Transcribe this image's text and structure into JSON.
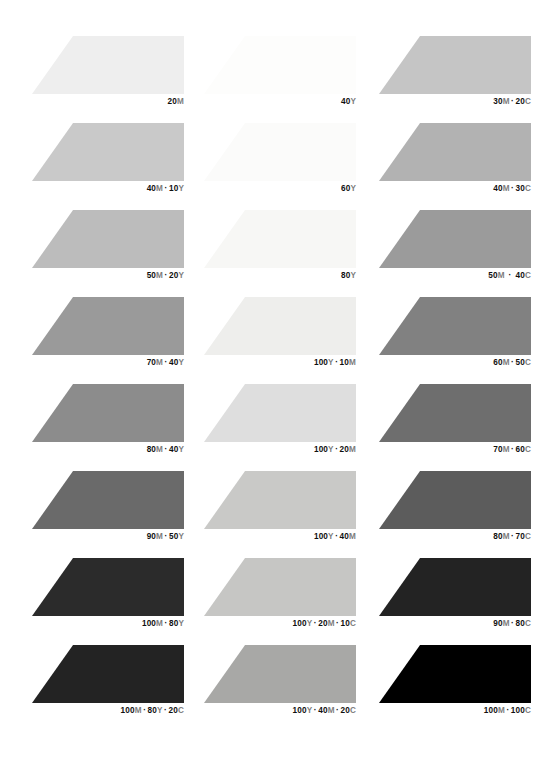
{
  "page": {
    "background": "#ffffff",
    "width": 540,
    "height": 758
  },
  "layout": {
    "columns": 3,
    "rows": 8,
    "column_x": [
      32,
      204,
      379
    ],
    "row_y": [
      36,
      123,
      210,
      297,
      384,
      471,
      558,
      645
    ],
    "swatch_width": 152,
    "swatch_height": 58,
    "slant_percent": 27
  },
  "chart_data": {
    "type": "table",
    "xlabel": "",
    "ylabel": "",
    "legend": [],
    "columns": [
      "Magenta + Yellow",
      "Yellow + Magenta + Cyan",
      "Magenta + Cyan"
    ],
    "categories": [
      "20M",
      "40Y",
      "30M · 20C",
      "40M · 10Y",
      "60Y",
      "40M · 30C",
      "50M · 20Y",
      "80Y",
      "50M · 40C",
      "70M · 40Y",
      "100Y · 10M",
      "60M · 50C",
      "80M · 40Y",
      "100Y · 20M",
      "70M · 60C",
      "90M · 50Y",
      "100Y · 40M",
      "80M · 70C",
      "100M · 80Y",
      "100Y · 20M · 10C",
      "90M · 80C",
      "100M · 80Y · 20C",
      "100Y · 40M · 20C",
      "100M · 100C"
    ],
    "values": [
      18,
      3,
      26,
      28,
      5,
      36,
      32,
      8,
      47,
      48,
      12,
      57,
      55,
      20,
      66,
      68,
      26,
      72,
      85,
      24,
      88,
      87,
      38,
      100
    ]
  },
  "swatches": [
    {
      "id": "swatch-r1c1",
      "row": 1,
      "col": 1,
      "color": "#eeeeee",
      "label_parts": [
        {
          "text": "20",
          "kind": "num"
        },
        {
          "text": "M",
          "kind": "ink"
        }
      ],
      "label_text": "20M",
      "wide": false
    },
    {
      "id": "swatch-r1c2",
      "row": 1,
      "col": 2,
      "color": "#fdfdfc",
      "label_parts": [
        {
          "text": "40",
          "kind": "num"
        },
        {
          "text": "Y",
          "kind": "ink"
        }
      ],
      "label_text": "40Y",
      "wide": false
    },
    {
      "id": "swatch-r1c3",
      "row": 1,
      "col": 3,
      "color": "#c5c5c5",
      "label_parts": [
        {
          "text": "30",
          "kind": "num"
        },
        {
          "text": "M",
          "kind": "ink"
        },
        {
          "text": "·",
          "kind": "sep"
        },
        {
          "text": "20",
          "kind": "num"
        },
        {
          "text": "C",
          "kind": "ink"
        }
      ],
      "label_text": "30M · 20C",
      "wide": false
    },
    {
      "id": "swatch-r2c1",
      "row": 2,
      "col": 1,
      "color": "#c9c9c9",
      "label_parts": [
        {
          "text": "40",
          "kind": "num"
        },
        {
          "text": "M",
          "kind": "ink"
        },
        {
          "text": "·",
          "kind": "sep"
        },
        {
          "text": "10",
          "kind": "num"
        },
        {
          "text": "Y",
          "kind": "ink"
        }
      ],
      "label_text": "40M · 10Y",
      "wide": false
    },
    {
      "id": "swatch-r2c2",
      "row": 2,
      "col": 2,
      "color": "#fbfbfa",
      "label_parts": [
        {
          "text": "60",
          "kind": "num"
        },
        {
          "text": "Y",
          "kind": "ink"
        }
      ],
      "label_text": "60Y",
      "wide": false
    },
    {
      "id": "swatch-r2c3",
      "row": 2,
      "col": 3,
      "color": "#b2b2b2",
      "label_parts": [
        {
          "text": "40",
          "kind": "num"
        },
        {
          "text": "M",
          "kind": "ink"
        },
        {
          "text": "·",
          "kind": "sep"
        },
        {
          "text": "30",
          "kind": "num"
        },
        {
          "text": "C",
          "kind": "ink"
        }
      ],
      "label_text": "40M · 30C",
      "wide": false
    },
    {
      "id": "swatch-r3c1",
      "row": 3,
      "col": 1,
      "color": "#bcbcbc",
      "label_parts": [
        {
          "text": "50",
          "kind": "num"
        },
        {
          "text": "M",
          "kind": "ink"
        },
        {
          "text": "·",
          "kind": "sep"
        },
        {
          "text": "20",
          "kind": "num"
        },
        {
          "text": "Y",
          "kind": "ink"
        }
      ],
      "label_text": "50M · 20Y",
      "wide": false
    },
    {
      "id": "swatch-r3c2",
      "row": 3,
      "col": 2,
      "color": "#f7f7f5",
      "label_parts": [
        {
          "text": "80",
          "kind": "num"
        },
        {
          "text": "Y",
          "kind": "ink"
        }
      ],
      "label_text": "80Y",
      "wide": false
    },
    {
      "id": "swatch-r3c3",
      "row": 3,
      "col": 3,
      "color": "#9b9b9b",
      "label_parts": [
        {
          "text": "50",
          "kind": "num"
        },
        {
          "text": "M",
          "kind": "ink"
        },
        {
          "text": "·",
          "kind": "sep"
        },
        {
          "text": "40",
          "kind": "num"
        },
        {
          "text": "C",
          "kind": "ink"
        }
      ],
      "label_text": "50M · 40C",
      "wide": true
    },
    {
      "id": "swatch-r4c1",
      "row": 4,
      "col": 1,
      "color": "#9a9a9a",
      "label_parts": [
        {
          "text": "70",
          "kind": "num"
        },
        {
          "text": "M",
          "kind": "ink"
        },
        {
          "text": "·",
          "kind": "sep"
        },
        {
          "text": "40",
          "kind": "num"
        },
        {
          "text": "Y",
          "kind": "ink"
        }
      ],
      "label_text": "70M · 40Y",
      "wide": false
    },
    {
      "id": "swatch-r4c2",
      "row": 4,
      "col": 2,
      "color": "#eeeeec",
      "label_parts": [
        {
          "text": "100",
          "kind": "num"
        },
        {
          "text": "Y",
          "kind": "ink"
        },
        {
          "text": "·",
          "kind": "sep"
        },
        {
          "text": "10",
          "kind": "num"
        },
        {
          "text": "M",
          "kind": "ink"
        }
      ],
      "label_text": "100Y · 10M",
      "wide": false
    },
    {
      "id": "swatch-r4c3",
      "row": 4,
      "col": 3,
      "color": "#818181",
      "label_parts": [
        {
          "text": "60",
          "kind": "num"
        },
        {
          "text": "M",
          "kind": "ink"
        },
        {
          "text": "·",
          "kind": "sep"
        },
        {
          "text": "50",
          "kind": "num"
        },
        {
          "text": "C",
          "kind": "ink"
        }
      ],
      "label_text": "60M · 50C",
      "wide": false
    },
    {
      "id": "swatch-r5c1",
      "row": 5,
      "col": 1,
      "color": "#8c8c8c",
      "label_parts": [
        {
          "text": "80",
          "kind": "num"
        },
        {
          "text": "M",
          "kind": "ink"
        },
        {
          "text": "·",
          "kind": "sep"
        },
        {
          "text": "40",
          "kind": "num"
        },
        {
          "text": "Y",
          "kind": "ink"
        }
      ],
      "label_text": "80M · 40Y",
      "wide": false
    },
    {
      "id": "swatch-r5c2",
      "row": 5,
      "col": 2,
      "color": "#dedede",
      "label_parts": [
        {
          "text": "100",
          "kind": "num"
        },
        {
          "text": "Y",
          "kind": "ink"
        },
        {
          "text": "·",
          "kind": "sep"
        },
        {
          "text": "20",
          "kind": "num"
        },
        {
          "text": "M",
          "kind": "ink"
        }
      ],
      "label_text": "100Y · 20M",
      "wide": false
    },
    {
      "id": "swatch-r5c3",
      "row": 5,
      "col": 3,
      "color": "#6e6e6e",
      "label_parts": [
        {
          "text": "70",
          "kind": "num"
        },
        {
          "text": "M",
          "kind": "ink"
        },
        {
          "text": "·",
          "kind": "sep"
        },
        {
          "text": "60",
          "kind": "num"
        },
        {
          "text": "C",
          "kind": "ink"
        }
      ],
      "label_text": "70M · 60C",
      "wide": false
    },
    {
      "id": "swatch-r6c1",
      "row": 6,
      "col": 1,
      "color": "#6a6a6a",
      "label_parts": [
        {
          "text": "90",
          "kind": "num"
        },
        {
          "text": "M",
          "kind": "ink"
        },
        {
          "text": "·",
          "kind": "sep"
        },
        {
          "text": "50",
          "kind": "num"
        },
        {
          "text": "Y",
          "kind": "ink"
        }
      ],
      "label_text": "90M · 50Y",
      "wide": false
    },
    {
      "id": "swatch-r6c2",
      "row": 6,
      "col": 2,
      "color": "#c9c9c7",
      "label_parts": [
        {
          "text": "100",
          "kind": "num"
        },
        {
          "text": "Y",
          "kind": "ink"
        },
        {
          "text": "·",
          "kind": "sep"
        },
        {
          "text": "40",
          "kind": "num"
        },
        {
          "text": "M",
          "kind": "ink"
        }
      ],
      "label_text": "100Y · 40M",
      "wide": false
    },
    {
      "id": "swatch-r6c3",
      "row": 6,
      "col": 3,
      "color": "#5c5c5c",
      "label_parts": [
        {
          "text": "80",
          "kind": "num"
        },
        {
          "text": "M",
          "kind": "ink"
        },
        {
          "text": "·",
          "kind": "sep"
        },
        {
          "text": "70",
          "kind": "num"
        },
        {
          "text": "C",
          "kind": "ink"
        }
      ],
      "label_text": "80M · 70C",
      "wide": false
    },
    {
      "id": "swatch-r7c1",
      "row": 7,
      "col": 1,
      "color": "#2b2b2b",
      "label_parts": [
        {
          "text": "100",
          "kind": "num"
        },
        {
          "text": "M",
          "kind": "ink"
        },
        {
          "text": "·",
          "kind": "sep"
        },
        {
          "text": "80",
          "kind": "num"
        },
        {
          "text": "Y",
          "kind": "ink"
        }
      ],
      "label_text": "100M · 80Y",
      "wide": false
    },
    {
      "id": "swatch-r7c2",
      "row": 7,
      "col": 2,
      "color": "#c6c6c4",
      "label_parts": [
        {
          "text": "100",
          "kind": "num"
        },
        {
          "text": "Y",
          "kind": "ink"
        },
        {
          "text": "·",
          "kind": "sep"
        },
        {
          "text": "20",
          "kind": "num"
        },
        {
          "text": "M",
          "kind": "ink"
        },
        {
          "text": "·",
          "kind": "sep"
        },
        {
          "text": "10",
          "kind": "num"
        },
        {
          "text": "C",
          "kind": "ink"
        }
      ],
      "label_text": "100Y · 20M · 10C",
      "wide": false
    },
    {
      "id": "swatch-r7c3",
      "row": 7,
      "col": 3,
      "color": "#232323",
      "label_parts": [
        {
          "text": "90",
          "kind": "num"
        },
        {
          "text": "M",
          "kind": "ink"
        },
        {
          "text": "·",
          "kind": "sep"
        },
        {
          "text": "80",
          "kind": "num"
        },
        {
          "text": "C",
          "kind": "ink"
        }
      ],
      "label_text": "90M · 80C",
      "wide": false
    },
    {
      "id": "swatch-r8c1",
      "row": 8,
      "col": 1,
      "color": "#232323",
      "label_parts": [
        {
          "text": "100",
          "kind": "num"
        },
        {
          "text": "M",
          "kind": "ink"
        },
        {
          "text": "·",
          "kind": "sep"
        },
        {
          "text": "80",
          "kind": "num"
        },
        {
          "text": "Y",
          "kind": "ink"
        },
        {
          "text": "·",
          "kind": "sep"
        },
        {
          "text": "20",
          "kind": "num"
        },
        {
          "text": "C",
          "kind": "ink"
        }
      ],
      "label_text": "100M · 80Y · 20C",
      "wide": false
    },
    {
      "id": "swatch-r8c2",
      "row": 8,
      "col": 2,
      "color": "#a8a8a6",
      "label_parts": [
        {
          "text": "100",
          "kind": "num"
        },
        {
          "text": "Y",
          "kind": "ink"
        },
        {
          "text": "·",
          "kind": "sep"
        },
        {
          "text": "40",
          "kind": "num"
        },
        {
          "text": "M",
          "kind": "ink"
        },
        {
          "text": "·",
          "kind": "sep"
        },
        {
          "text": "20",
          "kind": "num"
        },
        {
          "text": "C",
          "kind": "ink"
        }
      ],
      "label_text": "100Y · 40M · 20C",
      "wide": false
    },
    {
      "id": "swatch-r8c3",
      "row": 8,
      "col": 3,
      "color": "#000000",
      "label_parts": [
        {
          "text": "100",
          "kind": "num"
        },
        {
          "text": "M",
          "kind": "ink"
        },
        {
          "text": "·",
          "kind": "sep"
        },
        {
          "text": "100",
          "kind": "num"
        },
        {
          "text": "C",
          "kind": "ink"
        }
      ],
      "label_text": "100M · 100C",
      "wide": false
    }
  ]
}
